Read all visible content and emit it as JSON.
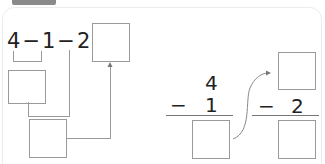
{
  "tab": {
    "label": "03"
  },
  "left_problem": {
    "expression": "4−1−2=",
    "terms": [
      "4",
      "1",
      "2"
    ],
    "operators": [
      "−",
      "−",
      "="
    ]
  },
  "right_problem": {
    "step1": {
      "top": "4",
      "operator": "−",
      "bottom": "1"
    },
    "step2": {
      "operator": "−",
      "bottom": "2"
    }
  },
  "colors": {
    "box_border": "#9a9a9a",
    "text": "#222222",
    "tab": "#8a8a8a"
  }
}
